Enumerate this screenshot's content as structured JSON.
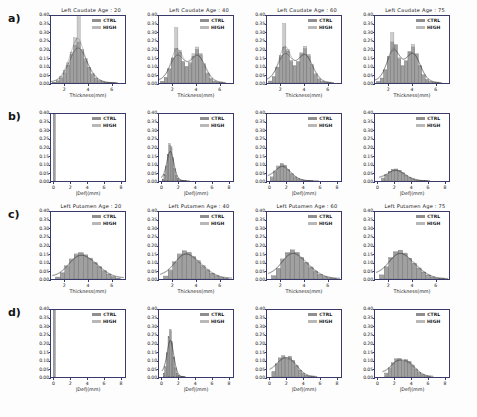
{
  "figure": {
    "row_labels": [
      "a)",
      "b)",
      "c)",
      "d)"
    ],
    "legend": [
      {
        "label": "CTRL",
        "color": "#8f8f8f"
      },
      {
        "label": "HIGH",
        "color": "#b8b8b8"
      }
    ],
    "yticks": [
      "0.00",
      "0.05",
      "0.10",
      "0.15",
      "0.20",
      "0.25",
      "0.30",
      "0.35",
      "0.40"
    ],
    "ylim": [
      0.0,
      0.4
    ],
    "xlabel_thickness": "Thickness(mm)",
    "xlabel_deformation": "|Def|(mm)",
    "xticks_thickness": [
      "2",
      "4",
      "6"
    ],
    "xticks_deformation": [
      "0",
      "2",
      "4",
      "6",
      "8"
    ],
    "xlim_thickness": [
      0.8,
      7.2
    ],
    "xlim_deformation": [
      -0.4,
      8.6
    ],
    "colors": {
      "ctrl_fill": "#8f8f8f",
      "high_fill": "#b8b8b8",
      "kde_line": "#2b2b2b",
      "axis": "#3a3a6a",
      "background": "#ffffff"
    }
  },
  "chart_data": [
    {
      "type": "bar",
      "panel_id": "a1",
      "row": "a)",
      "title": "Left Caudate Age : 20",
      "xlabel": "Thickness(mm)",
      "ylabel": "",
      "xlim": [
        0.8,
        7.2
      ],
      "ylim": [
        0.0,
        0.4
      ],
      "x": [
        1.1,
        1.4,
        1.7,
        2.0,
        2.3,
        2.6,
        2.9,
        3.2,
        3.5,
        3.8,
        4.1,
        4.4,
        4.7,
        5.0,
        5.3,
        5.6,
        5.9,
        6.2
      ],
      "series": [
        {
          "name": "CTRL",
          "values": [
            0.005,
            0.012,
            0.03,
            0.06,
            0.105,
            0.17,
            0.225,
            0.245,
            0.2,
            0.145,
            0.095,
            0.055,
            0.03,
            0.015,
            0.008,
            0.004,
            0.002,
            0.001
          ]
        },
        {
          "name": "HIGH",
          "values": [
            0.004,
            0.014,
            0.038,
            0.075,
            0.12,
            0.185,
            0.27,
            0.395,
            0.185,
            0.13,
            0.085,
            0.048,
            0.025,
            0.012,
            0.006,
            0.003,
            0.001,
            0.001
          ]
        }
      ]
    },
    {
      "type": "bar",
      "panel_id": "a2",
      "row": "a)",
      "title": "Left Caudate Age : 40",
      "xlabel": "Thickness(mm)",
      "ylabel": "",
      "xlim": [
        0.8,
        7.2
      ],
      "ylim": [
        0.0,
        0.4
      ],
      "x": [
        1.1,
        1.4,
        1.7,
        2.0,
        2.3,
        2.6,
        2.9,
        3.2,
        3.5,
        3.8,
        4.1,
        4.4,
        4.7,
        5.0,
        5.3,
        5.6,
        5.9,
        6.2
      ],
      "series": [
        {
          "name": "CTRL",
          "values": [
            0.01,
            0.035,
            0.085,
            0.15,
            0.205,
            0.185,
            0.13,
            0.1,
            0.115,
            0.16,
            0.2,
            0.175,
            0.115,
            0.06,
            0.028,
            0.012,
            0.005,
            0.002
          ]
        },
        {
          "name": "HIGH",
          "values": [
            0.008,
            0.03,
            0.08,
            0.145,
            0.33,
            0.195,
            0.12,
            0.095,
            0.125,
            0.175,
            0.215,
            0.165,
            0.1,
            0.05,
            0.022,
            0.009,
            0.004,
            0.002
          ]
        }
      ]
    },
    {
      "type": "bar",
      "panel_id": "a3",
      "row": "a)",
      "title": "Left Caudate Age : 60",
      "xlabel": "Thickness(mm)",
      "ylabel": "",
      "xlim": [
        0.8,
        7.2
      ],
      "ylim": [
        0.0,
        0.4
      ],
      "x": [
        1.1,
        1.4,
        1.7,
        2.0,
        2.3,
        2.6,
        2.9,
        3.2,
        3.5,
        3.8,
        4.1,
        4.4,
        4.7,
        5.0,
        5.3,
        5.6,
        5.9,
        6.2
      ],
      "series": [
        {
          "name": "CTRL",
          "values": [
            0.012,
            0.04,
            0.095,
            0.165,
            0.215,
            0.19,
            0.135,
            0.105,
            0.125,
            0.175,
            0.205,
            0.17,
            0.11,
            0.055,
            0.025,
            0.01,
            0.004,
            0.002
          ]
        },
        {
          "name": "HIGH",
          "values": [
            0.01,
            0.035,
            0.09,
            0.155,
            0.355,
            0.2,
            0.125,
            0.1,
            0.13,
            0.18,
            0.22,
            0.16,
            0.095,
            0.045,
            0.02,
            0.008,
            0.003,
            0.001
          ]
        }
      ]
    },
    {
      "type": "bar",
      "panel_id": "a4",
      "row": "a)",
      "title": "Left Caudate Age : 75",
      "xlabel": "Thickness(mm)",
      "ylabel": "",
      "xlim": [
        0.8,
        7.2
      ],
      "ylim": [
        0.0,
        0.4
      ],
      "x": [
        1.1,
        1.4,
        1.7,
        2.0,
        2.3,
        2.6,
        2.9,
        3.2,
        3.5,
        3.8,
        4.1,
        4.4,
        4.7,
        5.0,
        5.3,
        5.6,
        5.9,
        6.2
      ],
      "series": [
        {
          "name": "CTRL",
          "values": [
            0.008,
            0.03,
            0.08,
            0.16,
            0.245,
            0.23,
            0.15,
            0.105,
            0.13,
            0.185,
            0.215,
            0.175,
            0.105,
            0.05,
            0.022,
            0.009,
            0.004,
            0.002
          ]
        },
        {
          "name": "HIGH",
          "values": [
            0.007,
            0.028,
            0.075,
            0.15,
            0.3,
            0.225,
            0.14,
            0.1,
            0.135,
            0.19,
            0.23,
            0.17,
            0.1,
            0.045,
            0.018,
            0.007,
            0.003,
            0.001
          ]
        }
      ]
    },
    {
      "type": "bar",
      "panel_id": "b1",
      "row": "b)",
      "title": "",
      "xlabel": "|Def|(mm)",
      "ylabel": "",
      "xlim": [
        -0.4,
        8.6
      ],
      "ylim": [
        0.0,
        0.4
      ],
      "x": [
        0.0
      ],
      "series": [
        {
          "name": "CTRL",
          "values": [
            0.4
          ]
        },
        {
          "name": "HIGH",
          "values": [
            0.4
          ]
        }
      ]
    },
    {
      "type": "bar",
      "panel_id": "b2",
      "row": "b)",
      "title": "",
      "xlabel": "|Def|(mm)",
      "ylabel": "",
      "xlim": [
        -0.4,
        8.6
      ],
      "ylim": [
        0.0,
        0.4
      ],
      "x": [
        0.1,
        0.3,
        0.5,
        0.7,
        0.9,
        1.1,
        1.3,
        1.5,
        1.7,
        1.9,
        2.1,
        2.3,
        2.5,
        2.7,
        2.9,
        3.1
      ],
      "series": [
        {
          "name": "CTRL",
          "values": [
            0.01,
            0.035,
            0.085,
            0.155,
            0.215,
            0.205,
            0.14,
            0.075,
            0.035,
            0.015,
            0.007,
            0.003,
            0.002,
            0.001,
            0.001,
            0.0
          ]
        },
        {
          "name": "HIGH",
          "values": [
            0.012,
            0.04,
            0.09,
            0.16,
            0.225,
            0.195,
            0.13,
            0.07,
            0.03,
            0.013,
            0.006,
            0.003,
            0.001,
            0.001,
            0.0,
            0.0
          ]
        }
      ]
    },
    {
      "type": "bar",
      "panel_id": "b3",
      "row": "b)",
      "title": "",
      "xlabel": "|Def|(mm)",
      "ylabel": "",
      "xlim": [
        -0.4,
        8.6
      ],
      "ylim": [
        0.0,
        0.4
      ],
      "x": [
        0.2,
        0.6,
        1.0,
        1.4,
        1.8,
        2.2,
        2.6,
        3.0,
        3.4,
        3.8,
        4.2,
        4.6,
        5.0,
        5.4
      ],
      "series": [
        {
          "name": "CTRL",
          "values": [
            0.02,
            0.055,
            0.085,
            0.105,
            0.095,
            0.07,
            0.045,
            0.025,
            0.014,
            0.007,
            0.004,
            0.002,
            0.001,
            0.0
          ]
        },
        {
          "name": "HIGH",
          "values": [
            0.025,
            0.06,
            0.09,
            0.1,
            0.09,
            0.065,
            0.04,
            0.022,
            0.012,
            0.006,
            0.003,
            0.001,
            0.001,
            0.0
          ]
        }
      ]
    },
    {
      "type": "bar",
      "panel_id": "b4",
      "row": "b)",
      "title": "",
      "xlabel": "|Def|(mm)",
      "ylabel": "",
      "xlim": [
        -0.4,
        8.6
      ],
      "ylim": [
        0.0,
        0.4
      ],
      "x": [
        0.6,
        1.0,
        1.4,
        1.8,
        2.2,
        2.6,
        3.0,
        3.4,
        3.8,
        4.2,
        4.6,
        5.0,
        5.4,
        5.8
      ],
      "series": [
        {
          "name": "CTRL",
          "values": [
            0.015,
            0.035,
            0.055,
            0.068,
            0.072,
            0.065,
            0.05,
            0.035,
            0.022,
            0.013,
            0.007,
            0.004,
            0.002,
            0.001
          ]
        },
        {
          "name": "HIGH",
          "values": [
            0.018,
            0.04,
            0.058,
            0.07,
            0.068,
            0.06,
            0.046,
            0.03,
            0.018,
            0.01,
            0.005,
            0.003,
            0.001,
            0.001
          ]
        }
      ]
    },
    {
      "type": "bar",
      "panel_id": "c1",
      "row": "c)",
      "title": "Left Putamen Age : 20",
      "xlabel": "Thickness(mm)",
      "ylabel": "",
      "xlim": [
        0.8,
        7.2
      ],
      "ylim": [
        0.0,
        0.4
      ],
      "x": [
        1.4,
        1.8,
        2.2,
        2.6,
        3.0,
        3.4,
        3.8,
        4.2,
        4.6,
        5.0,
        5.4,
        5.8,
        6.2,
        6.6
      ],
      "series": [
        {
          "name": "CTRL",
          "values": [
            0.01,
            0.035,
            0.075,
            0.115,
            0.145,
            0.155,
            0.145,
            0.125,
            0.1,
            0.075,
            0.05,
            0.03,
            0.015,
            0.006
          ]
        },
        {
          "name": "HIGH",
          "values": [
            0.012,
            0.04,
            0.08,
            0.12,
            0.15,
            0.16,
            0.14,
            0.12,
            0.095,
            0.07,
            0.045,
            0.026,
            0.012,
            0.005
          ]
        }
      ]
    },
    {
      "type": "bar",
      "panel_id": "c2",
      "row": "c)",
      "title": "Left Putamen Age : 40",
      "xlabel": "Thickness(mm)",
      "ylabel": "",
      "xlim": [
        0.8,
        7.2
      ],
      "ylim": [
        0.0,
        0.4
      ],
      "x": [
        1.4,
        1.8,
        2.2,
        2.6,
        3.0,
        3.4,
        3.8,
        4.2,
        4.6,
        5.0,
        5.4,
        5.8,
        6.2,
        6.6
      ],
      "series": [
        {
          "name": "CTRL",
          "values": [
            0.015,
            0.05,
            0.1,
            0.145,
            0.165,
            0.16,
            0.135,
            0.11,
            0.08,
            0.055,
            0.035,
            0.02,
            0.009,
            0.004
          ]
        },
        {
          "name": "HIGH",
          "values": [
            0.018,
            0.055,
            0.105,
            0.15,
            0.17,
            0.155,
            0.13,
            0.1,
            0.072,
            0.048,
            0.03,
            0.016,
            0.007,
            0.003
          ]
        }
      ]
    },
    {
      "type": "bar",
      "panel_id": "c3",
      "row": "c)",
      "title": "Left Putamen Age : 60",
      "xlabel": "Thickness(mm)",
      "ylabel": "",
      "xlim": [
        0.8,
        7.2
      ],
      "ylim": [
        0.0,
        0.4
      ],
      "x": [
        1.4,
        1.8,
        2.2,
        2.6,
        3.0,
        3.4,
        3.8,
        4.2,
        4.6,
        5.0,
        5.4,
        5.8,
        6.2,
        6.6
      ],
      "series": [
        {
          "name": "CTRL",
          "values": [
            0.018,
            0.06,
            0.115,
            0.155,
            0.17,
            0.16,
            0.13,
            0.1,
            0.072,
            0.048,
            0.028,
            0.015,
            0.007,
            0.003
          ]
        },
        {
          "name": "HIGH",
          "values": [
            0.02,
            0.065,
            0.12,
            0.16,
            0.175,
            0.155,
            0.125,
            0.095,
            0.066,
            0.042,
            0.024,
            0.012,
            0.005,
            0.002
          ]
        }
      ]
    },
    {
      "type": "bar",
      "panel_id": "c4",
      "row": "c)",
      "title": "Left Putamen Age : 75",
      "xlabel": "Thickness(mm)",
      "ylabel": "",
      "xlim": [
        0.8,
        7.2
      ],
      "ylim": [
        0.0,
        0.4
      ],
      "x": [
        1.4,
        1.8,
        2.2,
        2.6,
        3.0,
        3.4,
        3.8,
        4.2,
        4.6,
        5.0,
        5.4,
        5.8,
        6.2,
        6.6
      ],
      "series": [
        {
          "name": "CTRL",
          "values": [
            0.022,
            0.07,
            0.125,
            0.16,
            0.17,
            0.155,
            0.125,
            0.095,
            0.066,
            0.042,
            0.024,
            0.012,
            0.005,
            0.002
          ]
        },
        {
          "name": "HIGH",
          "values": [
            0.025,
            0.075,
            0.13,
            0.165,
            0.172,
            0.15,
            0.12,
            0.09,
            0.06,
            0.038,
            0.021,
            0.01,
            0.004,
            0.002
          ]
        }
      ]
    },
    {
      "type": "bar",
      "panel_id": "d1",
      "row": "d)",
      "title": "",
      "xlabel": "|Def|(mm)",
      "ylabel": "",
      "xlim": [
        -0.4,
        8.6
      ],
      "ylim": [
        0.0,
        0.4
      ],
      "x": [
        0.0
      ],
      "series": [
        {
          "name": "CTRL",
          "values": [
            0.4
          ]
        },
        {
          "name": "HIGH",
          "values": [
            0.4
          ]
        }
      ]
    },
    {
      "type": "bar",
      "panel_id": "d2",
      "row": "d)",
      "title": "",
      "xlabel": "|Def|(mm)",
      "ylabel": "",
      "xlim": [
        -0.4,
        8.6
      ],
      "ylim": [
        0.0,
        0.4
      ],
      "x": [
        0.2,
        0.4,
        0.6,
        0.8,
        1.0,
        1.2,
        1.4,
        1.6,
        1.8,
        2.0,
        2.2,
        2.4,
        2.6
      ],
      "series": [
        {
          "name": "CTRL",
          "values": [
            0.02,
            0.06,
            0.14,
            0.235,
            0.285,
            0.21,
            0.12,
            0.055,
            0.022,
            0.009,
            0.004,
            0.002,
            0.001
          ]
        },
        {
          "name": "HIGH",
          "values": [
            0.022,
            0.065,
            0.145,
            0.24,
            0.275,
            0.2,
            0.11,
            0.05,
            0.02,
            0.008,
            0.003,
            0.001,
            0.001
          ]
        }
      ]
    },
    {
      "type": "bar",
      "panel_id": "d3",
      "row": "d)",
      "title": "",
      "xlabel": "|Def|(mm)",
      "ylabel": "",
      "xlim": [
        -0.4,
        8.6
      ],
      "ylim": [
        0.0,
        0.4
      ],
      "x": [
        0.4,
        0.8,
        1.2,
        1.6,
        2.0,
        2.4,
        2.8,
        3.2,
        3.6,
        4.0,
        4.4,
        4.8,
        5.2
      ],
      "series": [
        {
          "name": "CTRL",
          "values": [
            0.03,
            0.075,
            0.11,
            0.128,
            0.115,
            0.125,
            0.1,
            0.07,
            0.042,
            0.022,
            0.011,
            0.005,
            0.002
          ]
        },
        {
          "name": "HIGH",
          "values": [
            0.035,
            0.08,
            0.115,
            0.12,
            0.105,
            0.118,
            0.095,
            0.065,
            0.038,
            0.019,
            0.009,
            0.004,
            0.002
          ]
        }
      ]
    },
    {
      "type": "bar",
      "panel_id": "d4",
      "row": "d)",
      "title": "",
      "xlabel": "|Def|(mm)",
      "ylabel": "",
      "xlim": [
        -0.4,
        8.6
      ],
      "ylim": [
        0.0,
        0.4
      ],
      "x": [
        1.0,
        1.4,
        1.8,
        2.2,
        2.6,
        3.0,
        3.4,
        3.8,
        4.2,
        4.6,
        5.0,
        5.4,
        5.8,
        6.2
      ],
      "series": [
        {
          "name": "CTRL",
          "values": [
            0.02,
            0.05,
            0.082,
            0.105,
            0.112,
            0.098,
            0.105,
            0.095,
            0.072,
            0.048,
            0.028,
            0.015,
            0.007,
            0.003
          ]
        },
        {
          "name": "HIGH",
          "values": [
            0.024,
            0.055,
            0.088,
            0.11,
            0.105,
            0.09,
            0.1,
            0.088,
            0.065,
            0.042,
            0.024,
            0.012,
            0.005,
            0.002
          ]
        }
      ]
    }
  ]
}
